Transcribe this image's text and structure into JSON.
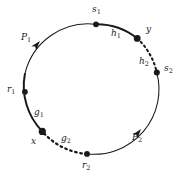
{
  "figure": {
    "kind": "circle-diagram",
    "background_color": "#ffffff",
    "stroke_color": "#1a1a1a",
    "circle": {
      "cx": 89,
      "cy": 89,
      "r": 65
    },
    "points": [
      {
        "name": "s1",
        "label": "s",
        "sub": "1",
        "x": 96,
        "y": 24,
        "dot_r": 2.9,
        "label_x": 92,
        "label_y": 6
      },
      {
        "name": "y",
        "label": "y",
        "sub": "",
        "x": 137,
        "y": 38,
        "dot_r": 3.4,
        "label_x": 146,
        "label_y": 27
      },
      {
        "name": "s2",
        "label": "s",
        "sub": "2",
        "x": 157,
        "y": 73,
        "dot_r": 3.0,
        "label_x": 164,
        "label_y": 66
      },
      {
        "name": "r2",
        "label": "r",
        "sub": "2",
        "x": 87,
        "y": 155,
        "dot_r": 2.9,
        "label_x": 83,
        "label_y": 161
      },
      {
        "name": "x",
        "label": "x",
        "sub": "",
        "x": 42,
        "y": 131,
        "dot_r": 3.6,
        "label_x": 33,
        "label_y": 138
      },
      {
        "name": "r1",
        "label": "r",
        "sub": "1",
        "x": 27,
        "y": 92,
        "dot_r": 2.9,
        "label_x": 8,
        "label_y": 86
      }
    ],
    "arc_labels": [
      {
        "name": "P1",
        "label": "P",
        "sub": "1",
        "label_x": 22,
        "label_y": 35,
        "style": "solid-thin"
      },
      {
        "name": "h1",
        "label": "h",
        "sub": "1",
        "label_x": 112,
        "label_y": 30,
        "style": "solid-thick"
      },
      {
        "name": "h2",
        "label": "h",
        "sub": "2",
        "label_x": 141,
        "label_y": 59,
        "style": "dashed-thick"
      },
      {
        "name": "g1",
        "label": "g",
        "sub": "1",
        "label_x": 35,
        "label_y": 110,
        "style": "solid-thick"
      },
      {
        "name": "g2",
        "label": "g",
        "sub": "2",
        "label_x": 62,
        "label_y": 136,
        "style": "dashed-thick"
      },
      {
        "name": "P2",
        "label": "P",
        "sub": "2",
        "label_x": 133,
        "label_y": 135,
        "style": "solid-thin"
      }
    ],
    "arrowheads": [
      {
        "name": "P1-arrowhead",
        "x": 40,
        "y": 41,
        "angle_deg": -49
      },
      {
        "name": "P2-arrowhead",
        "x": 141,
        "y": 129,
        "angle_deg": -52
      }
    ]
  }
}
